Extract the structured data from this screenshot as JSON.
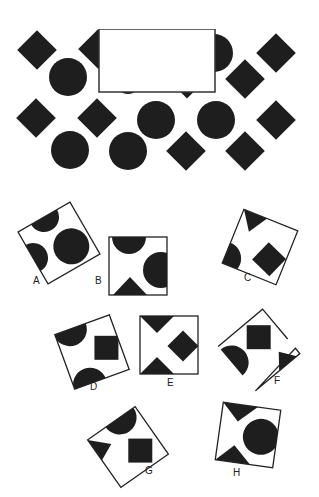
{
  "puzzle": {
    "ink_color": "#1e1e1e",
    "pattern": {
      "diamonds": [
        [
          37,
          50
        ],
        [
          97,
          47
        ],
        [
          276,
          52
        ],
        [
          246,
          79
        ],
        [
          37,
          118
        ],
        [
          97,
          118
        ],
        [
          186,
          151
        ],
        [
          246,
          152
        ],
        [
          276,
          120
        ]
      ],
      "circles": [
        [
          68,
          77
        ],
        [
          156,
          120
        ],
        [
          216,
          120
        ],
        [
          70,
          150
        ],
        [
          128,
          150
        ]
      ],
      "half_circle_right": [
        214,
        54
      ],
      "missing_piece_box": {
        "x": 99,
        "y": 29,
        "w": 116,
        "h": 63
      }
    },
    "options": [
      {
        "label": "A",
        "label_pos": [
          33,
          281
        ]
      },
      {
        "label": "B",
        "label_pos": [
          95,
          281
        ]
      },
      {
        "label": "C",
        "label_pos": [
          244,
          278
        ]
      },
      {
        "label": "D",
        "label_pos": [
          92,
          386
        ]
      },
      {
        "label": "E",
        "label_pos": [
          168,
          381
        ]
      },
      {
        "label": "F",
        "label_pos": [
          276,
          381
        ]
      },
      {
        "label": "G",
        "label_pos": [
          144,
          470
        ]
      },
      {
        "label": "H",
        "label_pos": [
          234,
          471
        ]
      }
    ]
  }
}
